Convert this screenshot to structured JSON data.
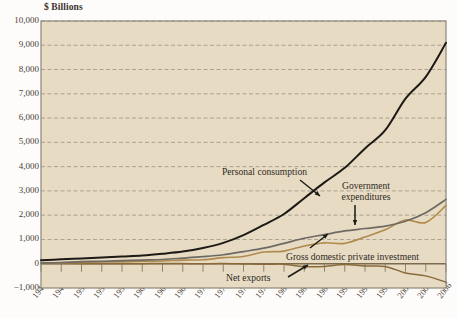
{
  "chart_data": {
    "type": "line",
    "title": "$ Billions",
    "xlabel": "",
    "ylabel": "$ Billions",
    "ylim": [
      -1000,
      10000
    ],
    "xlim": [
      1946,
      2006
    ],
    "grid": true,
    "legend_position": "inline-annotations",
    "ytick_labels": [
      "10,000",
      "9,000",
      "8,000",
      "7,000",
      "6,000",
      "5,000",
      "4,000",
      "3,000",
      "2,000",
      "1,000",
      "0",
      "−1,000"
    ],
    "ytick_values": [
      10000,
      9000,
      8000,
      7000,
      6000,
      5000,
      4000,
      3000,
      2000,
      1000,
      0,
      -1000
    ],
    "xtick_labels": [
      "1946",
      "1949",
      "1952",
      "1955",
      "1958",
      "1961",
      "1964",
      "1967",
      "1970",
      "1973",
      "1976",
      "1979",
      "1982",
      "1985",
      "1988",
      "1991",
      "1994",
      "1997",
      "2000",
      "2003",
      "2006"
    ],
    "xtick_values": [
      1946,
      1949,
      1952,
      1955,
      1958,
      1961,
      1964,
      1967,
      1970,
      1973,
      1976,
      1979,
      1982,
      1985,
      1988,
      1991,
      1994,
      1997,
      2000,
      2003,
      2006
    ],
    "series": [
      {
        "name": "Personal consumption",
        "color": "#1d1a16",
        "width": 2.0,
        "x": [
          1946,
          1949,
          1952,
          1955,
          1958,
          1961,
          1964,
          1967,
          1970,
          1973,
          1976,
          1979,
          1982,
          1985,
          1988,
          1991,
          1994,
          1997,
          2000,
          2003,
          2006
        ],
        "values": [
          145,
          180,
          220,
          260,
          300,
          340,
          410,
          500,
          650,
          860,
          1180,
          1600,
          2050,
          2700,
          3350,
          3950,
          4750,
          5500,
          6800,
          7700,
          9100
        ]
      },
      {
        "name": "Government expenditures",
        "color": "#6e6a63",
        "width": 1.7,
        "x": [
          1946,
          1949,
          1952,
          1955,
          1958,
          1961,
          1964,
          1967,
          1970,
          1973,
          1976,
          1979,
          1982,
          1985,
          1988,
          1991,
          1994,
          1997,
          2000,
          2003,
          2006
        ],
        "values": [
          30,
          50,
          90,
          100,
          125,
          150,
          175,
          230,
          290,
          370,
          500,
          640,
          840,
          1050,
          1200,
          1350,
          1450,
          1550,
          1750,
          2100,
          2650
        ]
      },
      {
        "name": "Gross domestic private investment",
        "color": "#b08a4c",
        "width": 1.6,
        "x": [
          1946,
          1949,
          1952,
          1955,
          1958,
          1961,
          1964,
          1967,
          1970,
          1973,
          1976,
          1979,
          1982,
          1985,
          1988,
          1991,
          1994,
          1997,
          2000,
          2003,
          2006
        ],
        "values": [
          35,
          40,
          55,
          70,
          75,
          90,
          115,
          150,
          165,
          250,
          300,
          480,
          520,
          730,
          860,
          840,
          1100,
          1400,
          1800,
          1700,
          2400
        ]
      },
      {
        "name": "Net exports",
        "color": "#8a6a3a",
        "width": 1.5,
        "x": [
          1946,
          1949,
          1952,
          1955,
          1958,
          1961,
          1964,
          1967,
          1970,
          1973,
          1976,
          1979,
          1982,
          1985,
          1988,
          1991,
          1994,
          1997,
          2000,
          2003,
          2006
        ],
        "values": [
          8,
          6,
          3,
          2,
          1,
          4,
          7,
          5,
          2,
          5,
          -10,
          -25,
          -20,
          -120,
          -110,
          -30,
          -95,
          -110,
          -380,
          -500,
          -760
        ]
      }
    ],
    "annotations": [
      {
        "text": "Personal consumption",
        "value": null
      },
      {
        "text": "Government\nexpenditures",
        "value": null
      },
      {
        "text": "Gross domestic private investment",
        "value": null
      },
      {
        "text": "Net exports",
        "value": null
      }
    ],
    "annotation_labels": {
      "personal_consumption": "Personal consumption",
      "government_expenditures_line1": "Government",
      "government_expenditures_line2": "expenditures",
      "gross_domestic_private_investment": "Gross domestic private investment",
      "net_exports": "Net exports"
    },
    "colors": {
      "plot_background": "#e7dbc3",
      "page_background": "#fdfcfa",
      "frame": "#8e8577",
      "gridline": "#9a9183",
      "personal_consumption": "#1d1a16",
      "government_expenditures": "#6e6a63",
      "gross_domestic_private_investment": "#b08a4c",
      "net_exports": "#8a6a3a",
      "text": "#3b342c"
    }
  }
}
